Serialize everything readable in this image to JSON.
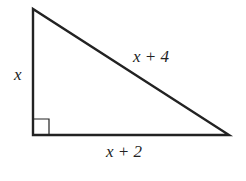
{
  "diagram": {
    "type": "right-triangle",
    "vertices": {
      "top": [
        33,
        9
      ],
      "right_angle": [
        33,
        135
      ],
      "bottom_right": [
        229,
        135
      ]
    },
    "right_angle_marker": {
      "size": 16
    },
    "stroke_color": "#222222",
    "labels": {
      "vertical_leg": "x",
      "hypotenuse": "x + 4",
      "horizontal_leg": "x + 2"
    }
  }
}
